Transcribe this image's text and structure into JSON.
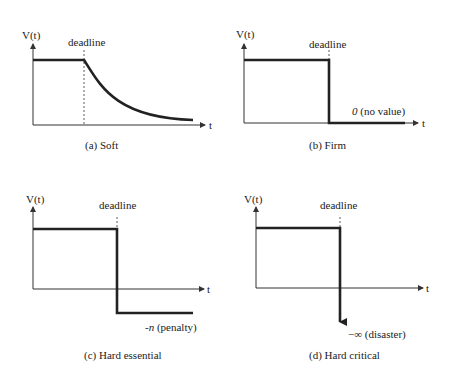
{
  "panels": [
    {
      "id": "a",
      "caption": "(a) Soft",
      "y_axis_label": "V(t)",
      "x_axis_label": "t",
      "deadline_label": "deadline",
      "annotation": ""
    },
    {
      "id": "b",
      "caption": "(b) Firm",
      "y_axis_label": "V(t)",
      "x_axis_label": "t",
      "deadline_label": "deadline",
      "annotation_value": "0",
      "annotation_text": " (no value)"
    },
    {
      "id": "c",
      "caption": "(c) Hard essential",
      "y_axis_label": "V(t)",
      "x_axis_label": "t",
      "deadline_label": "deadline",
      "annotation_value": "-n",
      "annotation_text": " (penalty)"
    },
    {
      "id": "d",
      "caption": "(d) Hard critical",
      "y_axis_label": "V(t)",
      "x_axis_label": "t",
      "deadline_label": "deadline",
      "annotation_value": "−∞",
      "annotation_text": " (disaster)"
    }
  ],
  "colors": {
    "line": "#222222",
    "axis": "#333333",
    "background": "#ffffff"
  }
}
